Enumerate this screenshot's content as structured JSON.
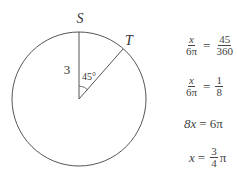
{
  "diagram": {
    "point_labels": {
      "top": "S",
      "right": "T"
    },
    "radius_label": "3",
    "angle_label": "45°",
    "angle_degrees": 45
  },
  "equations": [
    {
      "lhs_num": "x",
      "lhs_den": "6π",
      "op": "=",
      "rhs_num": "45",
      "rhs_den": "360"
    },
    {
      "lhs_num": "x",
      "lhs_den": "6π",
      "op": "=",
      "rhs_num": "1",
      "rhs_den": "8"
    },
    {
      "lhs": "8x",
      "op": "=",
      "rhs": "6π"
    },
    {
      "lhs": "x",
      "op": "=",
      "rhs_num": "3",
      "rhs_den": "4",
      "rhs_suffix": "π"
    }
  ]
}
